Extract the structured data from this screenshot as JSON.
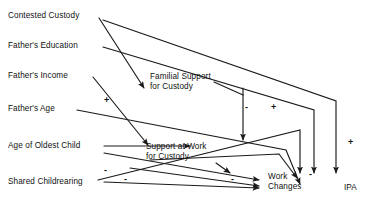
{
  "diagram": {
    "type": "path-diagram",
    "background_color": "#ffffff",
    "line_color": "#1a1a1a",
    "text_color": "#111111",
    "width": 382,
    "height": 200,
    "exogenous_nodes": [
      {
        "id": "contested-custody",
        "label": "Contested Custody",
        "x": 8,
        "y": 11
      },
      {
        "id": "fathers-education",
        "label": "Father's Education",
        "x": 8,
        "y": 41
      },
      {
        "id": "fathers-income",
        "label": "Father's Income",
        "x": 8,
        "y": 71
      },
      {
        "id": "fathers-age",
        "label": "Father's Age",
        "x": 8,
        "y": 104
      },
      {
        "id": "age-of-oldest-child",
        "label": "Age of Oldest Child",
        "x": 8,
        "y": 141
      },
      {
        "id": "shared-childrearing",
        "label": "Shared Childrearing",
        "x": 8,
        "y": 177
      }
    ],
    "mediator_nodes": [
      {
        "id": "familial-support-for-custody",
        "line1": "Familial Support",
        "line2": "for Custody",
        "x": 150,
        "y": 72
      },
      {
        "id": "support-at-work-for-custody",
        "line1": "Support at Work",
        "line2": "for Custody",
        "x": 146,
        "y": 142
      },
      {
        "id": "work-changes",
        "line1": "Work",
        "line2": "Changes",
        "x": 268,
        "y": 172
      }
    ],
    "outcome_nodes": [
      {
        "id": "ipa",
        "label": "IPA",
        "x": 344,
        "y": 183
      }
    ],
    "sign_labels": [
      {
        "id": "sign-1",
        "text": "+",
        "x": 104,
        "y": 96
      },
      {
        "id": "sign-2",
        "text": "-",
        "x": 245,
        "y": 103
      },
      {
        "id": "sign-3",
        "text": "+",
        "x": 271,
        "y": 103
      },
      {
        "id": "sign-4",
        "text": "+",
        "x": 348,
        "y": 138
      },
      {
        "id": "sign-5",
        "text": "-",
        "x": 104,
        "y": 166
      },
      {
        "id": "sign-6",
        "text": "-",
        "x": 124,
        "y": 175
      },
      {
        "id": "sign-7",
        "text": "-",
        "x": 231,
        "y": 175
      },
      {
        "id": "sign-8",
        "text": "-",
        "x": 309,
        "y": 170
      }
    ],
    "edges": [
      {
        "id": "edge-contested-custody-to-work-changes",
        "from": "contested-custody",
        "to": "work-changes"
      },
      {
        "id": "edge-contested-custody-to-ipa-top",
        "from": "contested-custody",
        "to": "ipa"
      },
      {
        "id": "edge-fathers-education-to-familial-support",
        "from": "fathers-education",
        "to": "familial-support-for-custody"
      },
      {
        "id": "edge-fathers-education-to-ipa",
        "from": "fathers-education",
        "to": "ipa"
      },
      {
        "id": "edge-fathers-income-to-support-at-work",
        "from": "fathers-income",
        "to": "support-at-work-for-custody"
      },
      {
        "id": "edge-fathers-age-to-ipa",
        "from": "fathers-age",
        "to": "ipa"
      },
      {
        "id": "edge-age-of-oldest-child-to-support-at-work",
        "from": "age-of-oldest-child",
        "to": "support-at-work-for-custody"
      },
      {
        "id": "edge-age-of-oldest-child-to-work-changes",
        "from": "age-of-oldest-child",
        "to": "work-changes"
      },
      {
        "id": "edge-shared-childrearing-to-work-changes",
        "from": "shared-childrearing",
        "to": "work-changes"
      },
      {
        "id": "edge-shared-childrearing-to-ipa",
        "from": "shared-childrearing",
        "to": "ipa"
      },
      {
        "id": "edge-familial-support-to-work-changes",
        "from": "familial-support-for-custody",
        "to": "work-changes"
      },
      {
        "id": "edge-support-at-work-to-ipa",
        "from": "support-at-work-for-custody",
        "to": "ipa"
      },
      {
        "id": "edge-work-changes-to-ipa",
        "from": "work-changes",
        "to": "ipa"
      }
    ]
  }
}
